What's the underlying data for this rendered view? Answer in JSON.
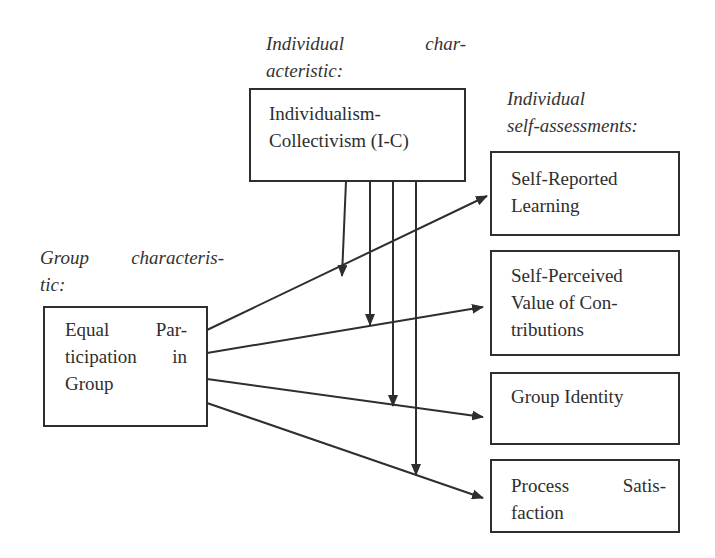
{
  "diagram": {
    "type": "research-model",
    "labels": {
      "individual_characteristic": [
        "Individual",
        "char-",
        "acteristic:"
      ],
      "individual_self_assessments": [
        "Individual",
        "self-assessments:"
      ],
      "group_characteristic": [
        "Group",
        "characteris-",
        "tic:"
      ]
    },
    "nodes": {
      "moderator": {
        "id": "ic",
        "lines": [
          "Individualism-",
          "Collectivism (I-C)"
        ]
      },
      "predictor": {
        "id": "equal-participation",
        "lines": [
          [
            "Equal",
            "Par-"
          ],
          [
            "ticipation",
            "in"
          ],
          [
            "Group"
          ]
        ]
      },
      "outcomes": [
        {
          "id": "self-reported-learning",
          "lines": [
            "Self-Reported",
            "Learning"
          ]
        },
        {
          "id": "self-perceived-value",
          "lines": [
            "Self-Perceived",
            "Value of Con-",
            "tributions"
          ]
        },
        {
          "id": "group-identity",
          "lines": [
            "Group Identity"
          ]
        },
        {
          "id": "process-satisfaction",
          "lines": [
            [
              "Process",
              "Satis-"
            ],
            [
              "faction"
            ]
          ]
        }
      ]
    },
    "edges": [
      {
        "from": "equal-participation",
        "to": "self-reported-learning",
        "type": "arrow"
      },
      {
        "from": "equal-participation",
        "to": "self-perceived-value",
        "type": "arrow"
      },
      {
        "from": "equal-participation",
        "to": "group-identity",
        "type": "arrow"
      },
      {
        "from": "equal-participation",
        "to": "process-satisfaction",
        "type": "arrow"
      },
      {
        "from": "ic",
        "to": "edge-1",
        "type": "moderation-arrow"
      },
      {
        "from": "ic",
        "to": "edge-2",
        "type": "moderation-arrow"
      },
      {
        "from": "ic",
        "to": "edge-3",
        "type": "moderation-arrow"
      },
      {
        "from": "ic",
        "to": "edge-4",
        "type": "moderation-arrow"
      }
    ],
    "colors": {
      "stroke": "#2e2e2e",
      "background": "#ffffff"
    }
  }
}
